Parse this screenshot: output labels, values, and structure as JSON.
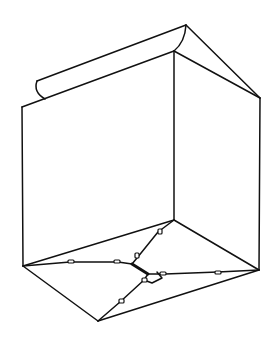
{
  "diagram": {
    "colors": {
      "background": "#ffffff",
      "stroke": "#111111"
    },
    "vertices": {
      "top_apex": [
        186,
        25
      ],
      "inner_top": [
        174,
        51
      ],
      "right_top": [
        260,
        98
      ],
      "left_top": [
        22,
        107
      ],
      "flap_left_top": [
        37,
        81
      ],
      "flap_curl_bottom": [
        45,
        99
      ],
      "inner_bottom": [
        174,
        220
      ],
      "left_bottom": [
        23,
        266
      ],
      "right_bottom": [
        259,
        270
      ],
      "bottom_apex": [
        98,
        321
      ],
      "center": [
        136,
        266
      ]
    }
  }
}
